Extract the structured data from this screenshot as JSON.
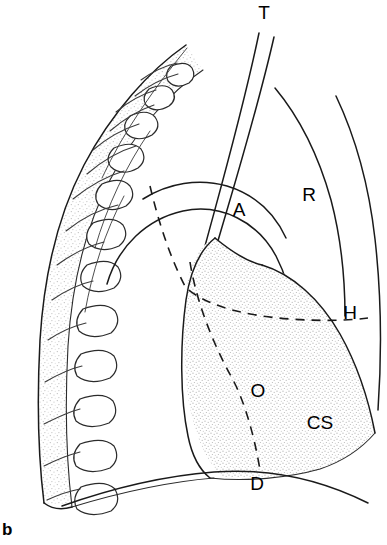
{
  "figure": {
    "panel_letter": "b",
    "background_color": "#ffffff",
    "line_color": "#1a1a1a",
    "stipple_color": "#cfcfcf",
    "width_px": 387,
    "height_px": 545
  },
  "labels": {
    "trachea": {
      "text": "T",
      "meaning": "trachea",
      "x": 264,
      "y": 14
    },
    "aortic_arch": {
      "text": "A",
      "meaning": "aortic arch",
      "x": 239,
      "y": 211
    },
    "right_lung": {
      "text": "R",
      "meaning": "right lung field",
      "x": 309,
      "y": 196
    },
    "hilum": {
      "text": "H",
      "meaning": "hilum",
      "x": 350,
      "y": 314
    },
    "oesophagus": {
      "text": "O",
      "meaning": "oesophagus",
      "x": 258,
      "y": 392
    },
    "cardiac_silhouette": {
      "text": "CS",
      "meaning": "cardiac silhouette",
      "x": 320,
      "y": 424
    },
    "diaphragm": {
      "text": "D",
      "meaning": "diaphragm",
      "x": 257,
      "y": 485
    }
  },
  "structures": {
    "spine_band": {
      "name": "thoracic-spine-band",
      "vertebra_count": 12,
      "fill": "stippled"
    },
    "ribs": {
      "name": "rib-shadows",
      "count": 11
    },
    "trachea_tube": {
      "name": "trachea-tube",
      "style": "two parallel lines"
    },
    "cardiac_shadow": {
      "name": "cardiac-silhouette-shadow",
      "fill": "stippled"
    },
    "dashed_markers": {
      "hilar_line": "dashed curve to hilum",
      "oesophageal_line": "dashed curve through oesophagus to diaphragm"
    }
  }
}
